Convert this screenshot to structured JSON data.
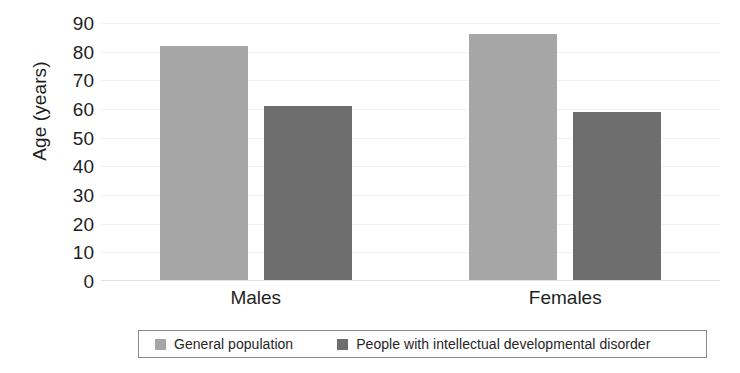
{
  "chart_data": {
    "type": "bar",
    "title": "",
    "subtitle": "",
    "xlabel": "",
    "ylabel": "Age (years)",
    "categories": [
      "Males",
      "Females"
    ],
    "series": [
      {
        "name": "General population",
        "color": "#a6a6a6",
        "values": [
          82,
          86
        ]
      },
      {
        "name": "People with intellectual developmental disorder",
        "color": "#6e6e6e",
        "values": [
          61,
          59
        ]
      }
    ],
    "ylim": [
      0,
      90
    ],
    "ytick_step": 10,
    "yticks": [
      90,
      80,
      70,
      60,
      50,
      40,
      30,
      20,
      10,
      0
    ],
    "grid": true,
    "grid_color": "#f1f1f1",
    "legend_position": "bottom"
  },
  "axis": {
    "y_title": "Age (years)",
    "tick_labels": [
      "90",
      "80",
      "70",
      "60",
      "50",
      "40",
      "30",
      "20",
      "10",
      "0"
    ]
  },
  "categories": {
    "labels": [
      "Males",
      "Females"
    ]
  },
  "legend": {
    "items": [
      {
        "label": "General population",
        "color": "#a6a6a6"
      },
      {
        "label": "People with intellectual developmental disorder",
        "color": "#6e6e6e"
      }
    ]
  },
  "colors": {
    "general_population": "#a6a6a6",
    "idd": "#6e6e6e",
    "gridline": "#f1f1f1",
    "text": "#1f1f1f",
    "legend_border": "#8a8a8a",
    "background": "#ffffff"
  }
}
